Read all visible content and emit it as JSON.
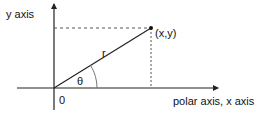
{
  "diagram": {
    "type": "polar-coordinates",
    "labels": {
      "y_axis": "y axis",
      "x_axis": "polar axis, x axis",
      "point": "(x,y)",
      "radius": "r",
      "angle": "θ",
      "origin": "0"
    },
    "colors": {
      "stroke": "#222222",
      "dashed": "#555555",
      "text": "#111111",
      "background": "#ffffff"
    },
    "geometry": {
      "origin": [
        54,
        88
      ],
      "point": [
        151,
        28
      ],
      "angle_arc_radius": 43
    }
  }
}
